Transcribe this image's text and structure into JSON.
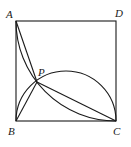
{
  "diagram": {
    "type": "geometry",
    "stroke_color": "#1a1a1a",
    "labels": {
      "A": "A",
      "B": "B",
      "C": "C",
      "D": "D",
      "P": "P"
    },
    "points": {
      "A": [
        16,
        21
      ],
      "B": [
        16,
        121
      ],
      "C": [
        116,
        121
      ],
      "D": [
        116,
        21
      ],
      "P": [
        37,
        82
      ]
    },
    "shapes": [
      {
        "kind": "square",
        "vertices": [
          "A",
          "B",
          "C",
          "D"
        ]
      },
      {
        "kind": "arc",
        "name": "quarter-arc-AC",
        "center": "D",
        "radius": 100,
        "from": "A",
        "to": "C"
      },
      {
        "kind": "semicircle",
        "name": "semicircle-BC",
        "diameter": [
          "B",
          "C"
        ]
      },
      {
        "kind": "segment",
        "from": "A",
        "to": "P"
      },
      {
        "kind": "segment",
        "from": "B",
        "to": "P"
      },
      {
        "kind": "segment",
        "from": "P",
        "to": "C"
      }
    ]
  }
}
